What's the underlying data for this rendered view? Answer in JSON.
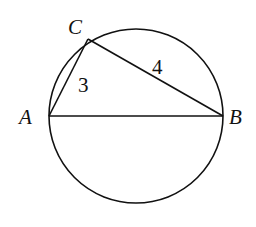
{
  "diagram": {
    "circle": {
      "cx": 136,
      "cy": 116,
      "r": 87
    },
    "points": {
      "A": {
        "label": "A",
        "x": 49,
        "y": 116
      },
      "B": {
        "label": "B",
        "x": 223,
        "y": 116
      },
      "C": {
        "label": "C",
        "x": 88,
        "y": 39
      }
    },
    "segments": [
      {
        "from": "A",
        "to": "C",
        "label": "3"
      },
      {
        "from": "C",
        "to": "B",
        "label": "4"
      },
      {
        "from": "A",
        "to": "B",
        "label": ""
      }
    ],
    "line_color": "#111111"
  }
}
